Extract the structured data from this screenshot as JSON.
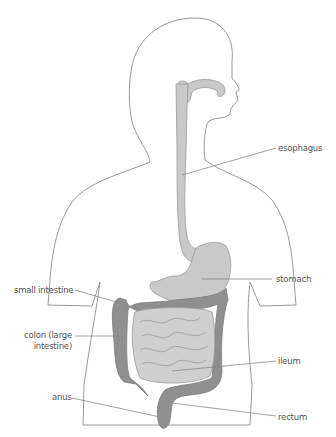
{
  "diagram": {
    "colors": {
      "outline": "#9a9a9a",
      "upper_tract": "#c9c9c9",
      "small_intestine": "#cfcfcf",
      "colon": "#8f8f8f",
      "leader_line": "#8a8a8a",
      "label_text": "#555555"
    },
    "labels": {
      "esophagus": "esophagus",
      "stomach": "stomach",
      "small_intestine": "small intestine",
      "colon_line1": "colon (large",
      "colon_line2": "intestine)",
      "ileum": "ileum",
      "anus": "anus",
      "rectum": "rectum"
    }
  }
}
